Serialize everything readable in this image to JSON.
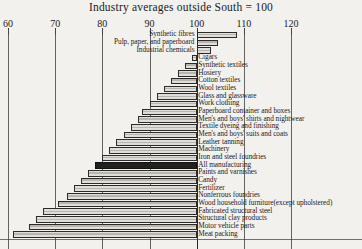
{
  "chart_data": {
    "type": "bar",
    "orientation": "horizontal",
    "title": "Industry averages outside South = 100",
    "xlabel": "",
    "ylabel": "",
    "xlim": [
      60,
      124
    ],
    "baseline": 100,
    "grid": true,
    "legend": false,
    "xticks": [
      60,
      70,
      80,
      90,
      100,
      110,
      120
    ],
    "xtick_labels": [
      "60",
      "70",
      "80",
      "90",
      "100",
      "110",
      "120"
    ],
    "highlight_category": "All manufacturing",
    "categories": [
      "Synthetic fibres",
      "Pulp, paper, and paperboard",
      "Industrial chemicals",
      "Cigars",
      "Synthetic textiles",
      "Hosiery",
      "Cotton textiles",
      "Wool textiles",
      "Glass and glassware",
      "Work clothing",
      "Paperboard container and boxes",
      "Men's and boys' shirts and nightwear",
      "Textile dyeing and finishing",
      "Men's and boys' suits and coats",
      "Leather tanning",
      "Machinery",
      "Iron and steel foundries",
      "All manufacturing",
      "Paints and varnishes",
      "Candy",
      "Fertilizer",
      "Nonferrous foundries",
      "Wood household furniture(except upholstered)",
      "Fabricated structural steel",
      "Structural clay products",
      "Motor vehicle parts",
      "Meat packing"
    ],
    "values": [
      108.5,
      104.5,
      103.0,
      99.0,
      97.5,
      96.0,
      94.5,
      93.0,
      91.5,
      90.0,
      88.5,
      87.5,
      86.0,
      84.5,
      83.0,
      81.5,
      80.0,
      78.5,
      77.0,
      75.5,
      74.0,
      72.5,
      70.5,
      67.5,
      66.0,
      64.5,
      61.0
    ],
    "label_side": [
      "left",
      "left",
      "left",
      "right",
      "right",
      "right",
      "right",
      "right",
      "right",
      "right",
      "right",
      "right",
      "right",
      "right",
      "right",
      "right",
      "right",
      "right",
      "right",
      "right",
      "right",
      "right",
      "right",
      "right",
      "right",
      "right",
      "right"
    ]
  }
}
